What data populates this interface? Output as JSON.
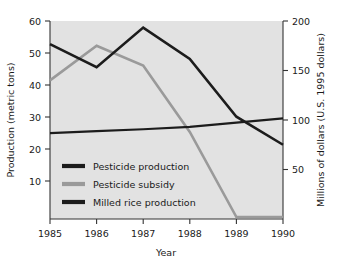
{
  "chart_data": {
    "type": "line",
    "title": "",
    "xlabel": "Year",
    "ylabel": "Production (metric tons)",
    "y2label": "Millions of dollars (U.S. 1995 dollars)",
    "categories": [
      "1985",
      "1986",
      "1987",
      "1988",
      "1989",
      "1990"
    ],
    "x": [
      1985,
      1986,
      1987,
      1988,
      1989,
      1990
    ],
    "xlim": [
      1985,
      1990
    ],
    "ylim": [
      0,
      60
    ],
    "y2lim": [
      0,
      200
    ],
    "yticks": [
      10,
      20,
      30,
      40,
      50,
      60
    ],
    "y2ticks": [
      50,
      100,
      150,
      200
    ],
    "xticks": [
      "1985",
      "1986",
      "1987",
      "1988",
      "1989",
      "1990"
    ],
    "grid": false,
    "legend_position": "lower-left-inside",
    "series": [
      {
        "name": "Pesticide production",
        "axis": "left",
        "color": "#1c1c1c",
        "width": 2.6,
        "values": [
          53,
          46,
          58,
          48.5,
          31,
          22.5
        ]
      },
      {
        "name": "Pesticide subsidy",
        "axis": "right",
        "color": "#9a9a9a",
        "width": 2.6,
        "values": [
          140,
          175,
          155,
          88,
          2,
          2
        ]
      },
      {
        "name": "Milled rice production",
        "axis": "left",
        "color": "#1c1c1c",
        "width": 2.2,
        "values": [
          26,
          26.6,
          27.2,
          27.9,
          29.2,
          30.5
        ]
      }
    ]
  },
  "legend": {
    "items": [
      {
        "label": "Pesticide production",
        "color": "#1c1c1c"
      },
      {
        "label": "Pesticide subsidy",
        "color": "#9a9a9a"
      },
      {
        "label": "Milled rice production",
        "color": "#1c1c1c"
      }
    ]
  },
  "axes": {
    "left": {
      "title": "Production (metric tons)",
      "ticks": [
        "10",
        "20",
        "30",
        "40",
        "50",
        "60"
      ]
    },
    "right": {
      "title": "Millions of dollars (U.S. 1995 dollars)",
      "ticks": [
        "50",
        "100",
        "150",
        "200"
      ]
    },
    "bottom": {
      "title": "Year",
      "ticks": [
        "1985",
        "1986",
        "1987",
        "1988",
        "1989",
        "1990"
      ]
    }
  },
  "colors": {
    "plot_background": "#e2e2e2",
    "page_background": "#ffffff",
    "axis": "#333333",
    "text": "#1a1a1a",
    "dark_series": "#1c1c1c",
    "gray_series": "#9a9a9a"
  }
}
